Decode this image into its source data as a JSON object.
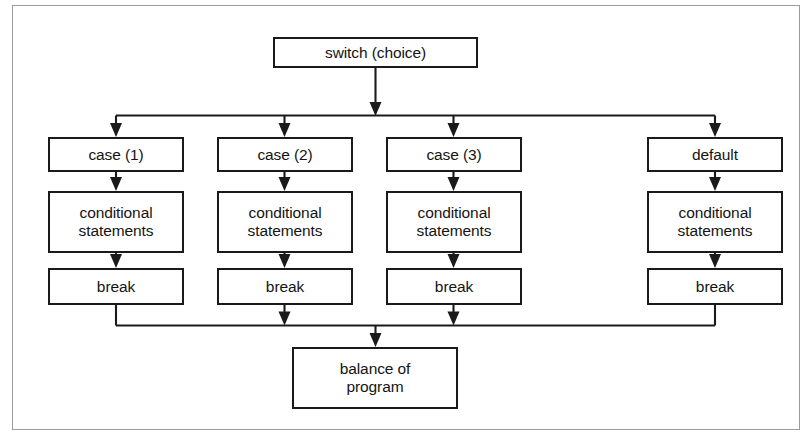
{
  "figure": {
    "kind": "flowchart",
    "frame_border_color": "#9b9b9b",
    "background_color": "#ffffff",
    "line_color": "#1a1a1a",
    "text_color": "#141414"
  },
  "nodes": {
    "switch": {
      "label": "switch (choice)"
    },
    "branches": [
      {
        "head": "case (1)",
        "body": "conditional\nstatements",
        "terminator": "break"
      },
      {
        "head": "case (2)",
        "body": "conditional\nstatements",
        "terminator": "break"
      },
      {
        "head": "case (3)",
        "body": "conditional\nstatements",
        "terminator": "break"
      },
      {
        "head": "default",
        "body": "conditional\nstatements",
        "terminator": "break"
      }
    ],
    "exit": {
      "label": "balance of\nprogram"
    }
  }
}
